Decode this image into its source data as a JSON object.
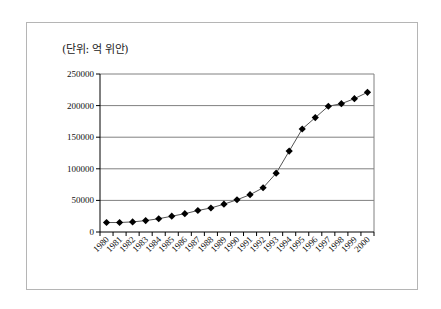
{
  "chart_data": {
    "type": "line",
    "title": "",
    "unit_label": "(단위: 억 위안)",
    "xlabel": "",
    "ylabel": "",
    "ylim": [
      0,
      250000
    ],
    "yticks": [
      0,
      50000,
      100000,
      150000,
      200000,
      250000
    ],
    "ytick_labels": [
      "0",
      "50000",
      "100000",
      "150000",
      "200000",
      "250000"
    ],
    "grid": true,
    "legend": null,
    "categories": [
      "1980",
      "1981",
      "1982",
      "1983",
      "1984",
      "1985",
      "1986",
      "1987",
      "1988",
      "1989",
      "1990",
      "1991",
      "1992",
      "1993",
      "1994",
      "1995",
      "1996",
      "1997",
      "1998",
      "1999",
      "2000"
    ],
    "series": [
      {
        "name": "",
        "marker": "diamond",
        "values": [
          15000,
          15000,
          16000,
          18000,
          21000,
          25000,
          29000,
          34000,
          38000,
          44000,
          51000,
          59000,
          70000,
          93000,
          128000,
          163000,
          181000,
          199000,
          203000,
          211000,
          221000
        ]
      }
    ]
  },
  "colors": {
    "line": "#555555",
    "marker": "#000000",
    "grid": "#808080",
    "frame": "#b5b5b5"
  }
}
